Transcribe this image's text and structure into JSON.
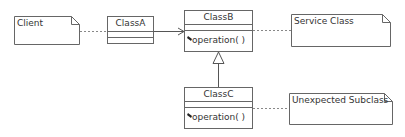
{
  "diagram": {
    "type": "uml-class-diagram",
    "notes": [
      {
        "id": "client",
        "text": "Client"
      },
      {
        "id": "service",
        "text": "Service Class"
      },
      {
        "id": "unexpected",
        "text": "Unexpected Subclass"
      }
    ],
    "classes": [
      {
        "id": "classA",
        "name": "ClassA",
        "operations": []
      },
      {
        "id": "classB",
        "name": "ClassB",
        "operations": [
          "operation( )"
        ]
      },
      {
        "id": "classC",
        "name": "ClassC",
        "operations": [
          "operation( )"
        ]
      }
    ],
    "relations": [
      {
        "from": "client",
        "to": "classA",
        "kind": "note-link"
      },
      {
        "from": "classA",
        "to": "classB",
        "kind": "association-navigable"
      },
      {
        "from": "classB",
        "to": "service",
        "kind": "note-link"
      },
      {
        "from": "classC",
        "to": "classB",
        "kind": "generalization"
      },
      {
        "from": "classC",
        "to": "unexpected",
        "kind": "note-link"
      }
    ]
  }
}
